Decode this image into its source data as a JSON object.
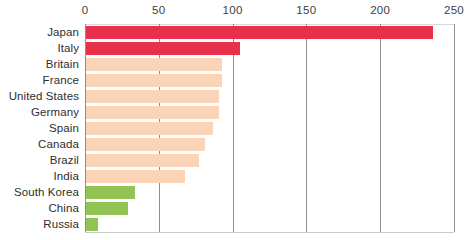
{
  "chart_data": {
    "type": "bar",
    "orientation": "horizontal",
    "title": "",
    "subtitle": "",
    "xlabel": "",
    "ylabel": "",
    "xlim": [
      0,
      250
    ],
    "xticks": [
      0,
      50,
      100,
      150,
      200,
      250
    ],
    "xtick_labels": [
      "0",
      "50",
      "100",
      "150",
      "200",
      "250"
    ],
    "grid": true,
    "grid_axis": "x",
    "legend": null,
    "categories": [
      "Japan",
      "Italy",
      "Britain",
      "France",
      "United States",
      "Germany",
      "Spain",
      "Canada",
      "Brazil",
      "India",
      "South Korea",
      "China",
      "Russia"
    ],
    "values": [
      236,
      105,
      93,
      93,
      91,
      91,
      87,
      81,
      77,
      68,
      34,
      29,
      9
    ],
    "bar_colors": [
      "#e8304a",
      "#e8304a",
      "#fbd3b6",
      "#fbd3b6",
      "#fbd3b6",
      "#fbd3b6",
      "#fbd3b6",
      "#fbd3b6",
      "#fbd3b6",
      "#fbd3b6",
      "#92c455",
      "#92c455",
      "#92c455"
    ],
    "colors": {
      "red": "#e8304a",
      "peach": "#fbd3b6",
      "green": "#92c455",
      "gridline": "#8e8e8e",
      "text": "#2e2e2e",
      "background": "#ffffff"
    }
  }
}
